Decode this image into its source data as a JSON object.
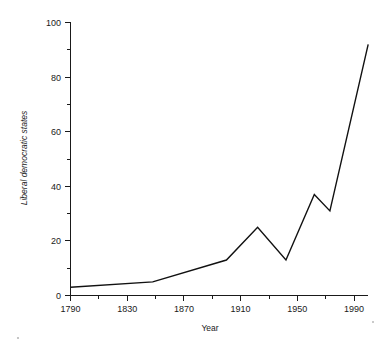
{
  "chart_data": {
    "type": "line",
    "title": "",
    "xlabel": "Year",
    "ylabel": "Liberal democratic states",
    "xlim": [
      1790,
      2000
    ],
    "ylim": [
      0,
      100
    ],
    "grid": false,
    "legend": null,
    "x_ticks": [
      1790,
      1830,
      1870,
      1910,
      1950,
      1990
    ],
    "x_tick_labels": [
      "1790",
      "1830",
      "1870",
      "1910",
      "1950",
      "1990"
    ],
    "x_minor_ticks": [
      1810,
      1850,
      1890,
      1930,
      1970
    ],
    "y_ticks": [
      0,
      20,
      40,
      60,
      80,
      100
    ],
    "y_tick_labels": [
      "0",
      "20",
      "40",
      "60",
      "80",
      "100"
    ],
    "y_minor_ticks": [
      10,
      30,
      50,
      70,
      90
    ],
    "series": [
      {
        "name": "Liberal democratic states",
        "color": "#111111",
        "x": [
          1790,
          1848,
          1900,
          1922,
          1942,
          1962,
          1973,
          2000
        ],
        "values": [
          3,
          5,
          13,
          25,
          13,
          37,
          31,
          92
        ]
      }
    ]
  },
  "axis_labels": {
    "y_title": "Liberal democratic states",
    "x_title": "Year"
  }
}
